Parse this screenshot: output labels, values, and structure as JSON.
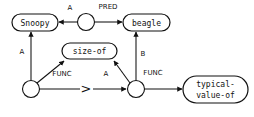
{
  "diagram": {
    "stroke_color": "#111111",
    "background_color": "#ffffff",
    "concept_nodes": [
      {
        "id": "snoopy",
        "label": "Snoopy"
      },
      {
        "id": "beagle",
        "label": "beagle"
      },
      {
        "id": "size-of",
        "label": "size-of"
      },
      {
        "id": "typical-value-of",
        "label_line1": "typical-",
        "label_line2": "value-of"
      }
    ],
    "relation_nodes": [
      {
        "id": "rel-pred",
        "label": ""
      },
      {
        "id": "rel-left",
        "label": ""
      },
      {
        "id": "rel-mid",
        "label": ""
      }
    ],
    "arc_labels": [
      {
        "id": "arc-a-top",
        "label": "A"
      },
      {
        "id": "arc-pred",
        "label": "PRED"
      },
      {
        "id": "arc-a-left",
        "label": "A"
      },
      {
        "id": "arc-func-left",
        "label": "FUNC"
      },
      {
        "id": "arc-a-mid",
        "label": "A"
      },
      {
        "id": "arc-b",
        "label": "B"
      },
      {
        "id": "arc-func-right",
        "label": "FUNC"
      }
    ],
    "comparison_symbol": ">"
  }
}
